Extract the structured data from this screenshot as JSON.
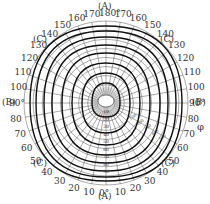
{
  "diagram": {
    "type": "polar-luminous-intensity-grid",
    "center": [
      106,
      103
    ],
    "outer_radius": 82,
    "region_labels": {
      "top": "(A)",
      "bottom": "(A)",
      "left": "(B)",
      "right": "(B)",
      "top_left": "(C)",
      "top_right": "(C)",
      "bottom_left": "(C)",
      "bottom_right": "(C)"
    },
    "phi_label": "φ",
    "angle_labels_left": [
      "170",
      "160",
      "150",
      "140",
      "130",
      "120",
      "110",
      "100",
      "90°",
      "80",
      "70",
      "60",
      "50",
      "40",
      "30",
      "20",
      "10"
    ],
    "angle_labels_right": [
      "170",
      "160",
      "150",
      "140",
      "130",
      "120",
      "110",
      "100",
      "90°",
      "80",
      "70",
      "60",
      "50",
      "40",
      "30",
      "20",
      "10"
    ],
    "top_angle": "180°",
    "bottom_angle": "0°",
    "center_scale": [
      "10",
      "20",
      "30",
      "40",
      "50",
      "60",
      "70",
      "80",
      "90"
    ],
    "diagonal_scale": [
      "100",
      "200",
      "300",
      "400",
      "500"
    ]
  }
}
